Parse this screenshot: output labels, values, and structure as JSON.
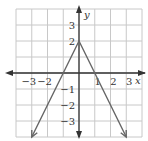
{
  "chart_data": {
    "type": "line",
    "title": "",
    "xlabel": "x",
    "ylabel": "y",
    "xlim": [
      -4,
      4
    ],
    "ylim": [
      -4,
      4
    ],
    "grid": true,
    "x_ticks": [
      "-3",
      "-2",
      "1",
      "2",
      "3"
    ],
    "y_ticks": [
      "3",
      "2",
      "-1",
      "-2",
      "-3"
    ],
    "series": [
      {
        "name": "y = -2|x| + 2",
        "points": [
          [
            -3,
            -4
          ],
          [
            0,
            2
          ],
          [
            3,
            -4
          ]
        ],
        "arrows_at_ends": true
      }
    ],
    "annotations": [
      "vertex (0, 2)",
      "x-intercepts at -1 and 1"
    ]
  },
  "colors": {
    "grid": "#c8c8c8",
    "axis": "#333333",
    "graph_line": "#666666"
  }
}
